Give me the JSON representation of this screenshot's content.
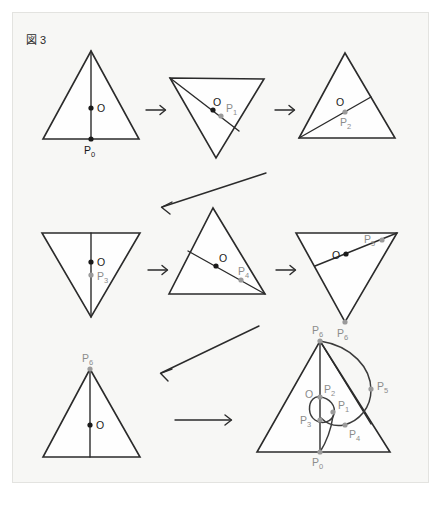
{
  "figure": {
    "caption_mark": "図",
    "caption_number": "3",
    "caption_full": "図 3",
    "background_color": "#f7f7f5",
    "page_color": "#ffffff",
    "stroke_color": "#2b2b2b",
    "marker_dark_color": "#1a1a1a",
    "marker_gray_color": "#9a9a9a"
  },
  "labels": {
    "center": "O",
    "p0": "P",
    "p0_sub": "0",
    "p1": "P",
    "p1_sub": "1",
    "p2": "P",
    "p2_sub": "2",
    "p3": "P",
    "p3_sub": "3",
    "p4": "P",
    "p4_sub": "4",
    "p5": "P",
    "p5_sub": "5",
    "p6": "P",
    "p6_sub": "6"
  },
  "panels": [
    {
      "id": "panel-1",
      "row": 1,
      "column": 1,
      "orientation": "apex-up",
      "markers": [
        {
          "name": "O",
          "style": "dark"
        },
        {
          "name": "P0",
          "style": "dark"
        }
      ],
      "chord": "vertical median from apex to base midpoint"
    },
    {
      "id": "panel-2",
      "row": 1,
      "column": 2,
      "orientation": "rotated-apex-down",
      "markers": [
        {
          "name": "O",
          "style": "dark"
        },
        {
          "name": "P1",
          "style": "gray"
        }
      ],
      "chord": "from top-left vertex through center to right edge"
    },
    {
      "id": "panel-3",
      "row": 1,
      "column": 3,
      "orientation": "apex-up",
      "markers": [
        {
          "name": "O",
          "style": "dark"
        },
        {
          "name": "P2",
          "style": "gray"
        }
      ],
      "chord": "from bottom-left vertex through center to right edge"
    },
    {
      "id": "panel-4",
      "row": 2,
      "column": 1,
      "orientation": "apex-down",
      "markers": [
        {
          "name": "O",
          "style": "dark"
        },
        {
          "name": "P3",
          "style": "gray"
        }
      ],
      "chord": "vertical median from top edge midpoint to bottom apex"
    },
    {
      "id": "panel-5",
      "row": 2,
      "column": 2,
      "orientation": "apex-up",
      "markers": [
        {
          "name": "O",
          "style": "dark"
        },
        {
          "name": "P4",
          "style": "gray"
        }
      ],
      "chord": "from left edge through center to bottom-right vertex"
    },
    {
      "id": "panel-6",
      "row": 2,
      "column": 3,
      "orientation": "apex-down",
      "markers": [
        {
          "name": "O",
          "style": "dark"
        },
        {
          "name": "P5",
          "style": "gray"
        },
        {
          "name": "P6",
          "style": "gray"
        }
      ],
      "chord": "from left edge through center up to top-right vertex"
    },
    {
      "id": "panel-7",
      "row": 3,
      "column": 1,
      "orientation": "apex-up",
      "markers": [
        {
          "name": "P6",
          "style": "gray"
        },
        {
          "name": "O",
          "style": "dark"
        }
      ],
      "chord": "vertical median from apex P6 to base"
    },
    {
      "id": "panel-8",
      "row": 3,
      "column": 3,
      "orientation": "apex-up",
      "markers": [
        {
          "name": "P6",
          "style": "gray"
        },
        {
          "name": "P5",
          "style": "gray"
        },
        {
          "name": "P4",
          "style": "gray"
        },
        {
          "name": "P3",
          "style": "gray"
        },
        {
          "name": "P2",
          "style": "gray"
        },
        {
          "name": "P1",
          "style": "gray"
        },
        {
          "name": "P0",
          "style": "gray"
        },
        {
          "name": "O",
          "style": "gray"
        }
      ],
      "chord": "composite traced rolling curve with loop near centre"
    }
  ],
  "arrows": [
    {
      "id": "arrow-1",
      "type": "horizontal",
      "direction": "right"
    },
    {
      "id": "arrow-2",
      "type": "horizontal",
      "direction": "right"
    },
    {
      "id": "arrow-3",
      "type": "diagonal",
      "direction": "down-left"
    },
    {
      "id": "arrow-4",
      "type": "horizontal",
      "direction": "right"
    },
    {
      "id": "arrow-5",
      "type": "horizontal",
      "direction": "right"
    },
    {
      "id": "arrow-6",
      "type": "diagonal",
      "direction": "down-left"
    },
    {
      "id": "arrow-7",
      "type": "horizontal-long",
      "direction": "right"
    }
  ]
}
